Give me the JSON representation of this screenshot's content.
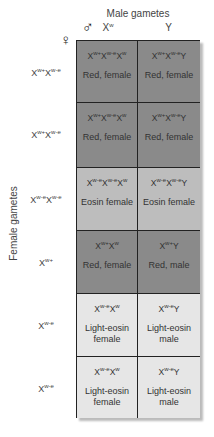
{
  "title": "Male gametes",
  "side_title": "Female gametes",
  "male_symbol": "♂",
  "female_symbol": "♀",
  "columns": [
    {
      "base": "X",
      "sup": "w"
    },
    {
      "base": "Y",
      "sup": ""
    }
  ],
  "rows": [
    {
      "label": [
        {
          "b": "X",
          "s": "w+"
        },
        {
          "b": "X",
          "s": "w-e"
        }
      ],
      "shade": "dark",
      "cells": [
        {
          "geno": [
            {
              "b": "X",
              "s": "w+"
            },
            {
              "b": "X",
              "s": "w-e"
            },
            {
              "b": "X",
              "s": "w"
            }
          ],
          "pheno": "Red, female"
        },
        {
          "geno": [
            {
              "b": "X",
              "s": "w+"
            },
            {
              "b": "X",
              "s": "w-e"
            },
            {
              "b": "Y",
              "s": ""
            }
          ],
          "pheno": "Red, female"
        }
      ]
    },
    {
      "label": [
        {
          "b": "X",
          "s": "w+"
        },
        {
          "b": "X",
          "s": "w-e"
        }
      ],
      "shade": "dark",
      "cells": [
        {
          "geno": [
            {
              "b": "X",
              "s": "w+"
            },
            {
              "b": "X",
              "s": "w-e"
            },
            {
              "b": "X",
              "s": "w"
            }
          ],
          "pheno": "Red, female"
        },
        {
          "geno": [
            {
              "b": "X",
              "s": "w+"
            },
            {
              "b": "X",
              "s": "w-e"
            },
            {
              "b": "Y",
              "s": ""
            }
          ],
          "pheno": "Red, female"
        }
      ]
    },
    {
      "label": [
        {
          "b": "X",
          "s": "w-e"
        },
        {
          "b": "X",
          "s": "w-e"
        }
      ],
      "shade": "mid",
      "cells": [
        {
          "geno": [
            {
              "b": "X",
              "s": "w-e"
            },
            {
              "b": "X",
              "s": "w-e"
            },
            {
              "b": "X",
              "s": "w"
            }
          ],
          "pheno": "Eosin female"
        },
        {
          "geno": [
            {
              "b": "X",
              "s": "w-e"
            },
            {
              "b": "X",
              "s": "w-e"
            },
            {
              "b": "Y",
              "s": ""
            }
          ],
          "pheno": "Eosin female"
        }
      ]
    },
    {
      "label": [
        {
          "b": "X",
          "s": "w+"
        }
      ],
      "shade": "dark",
      "cells": [
        {
          "geno": [
            {
              "b": "X",
              "s": "w+"
            },
            {
              "b": "X",
              "s": "w"
            }
          ],
          "pheno": "Red, female"
        },
        {
          "geno": [
            {
              "b": "X",
              "s": "w+"
            },
            {
              "b": "Y",
              "s": ""
            }
          ],
          "pheno": "Red, male"
        }
      ]
    },
    {
      "label": [
        {
          "b": "X",
          "s": "w-e"
        }
      ],
      "shade": "light",
      "cells": [
        {
          "geno": [
            {
              "b": "X",
              "s": "w-e"
            },
            {
              "b": "X",
              "s": "w"
            }
          ],
          "pheno": "Light-eosin female"
        },
        {
          "geno": [
            {
              "b": "X",
              "s": "w-e"
            },
            {
              "b": "Y",
              "s": ""
            }
          ],
          "pheno": "Light-eosin male"
        }
      ]
    },
    {
      "label": [
        {
          "b": "X",
          "s": "w-e"
        }
      ],
      "shade": "light",
      "cells": [
        {
          "geno": [
            {
              "b": "X",
              "s": "w-e"
            },
            {
              "b": "X",
              "s": "w"
            }
          ],
          "pheno": "Light-eosin female"
        },
        {
          "geno": [
            {
              "b": "X",
              "s": "w-e"
            },
            {
              "b": "Y",
              "s": ""
            }
          ],
          "pheno": "Light-eosin male"
        }
      ]
    }
  ],
  "colors": {
    "dark": "#8a8a8a",
    "mid": "#bdbdbd",
    "light": "#e6e6e6",
    "grid": "#222222"
  }
}
